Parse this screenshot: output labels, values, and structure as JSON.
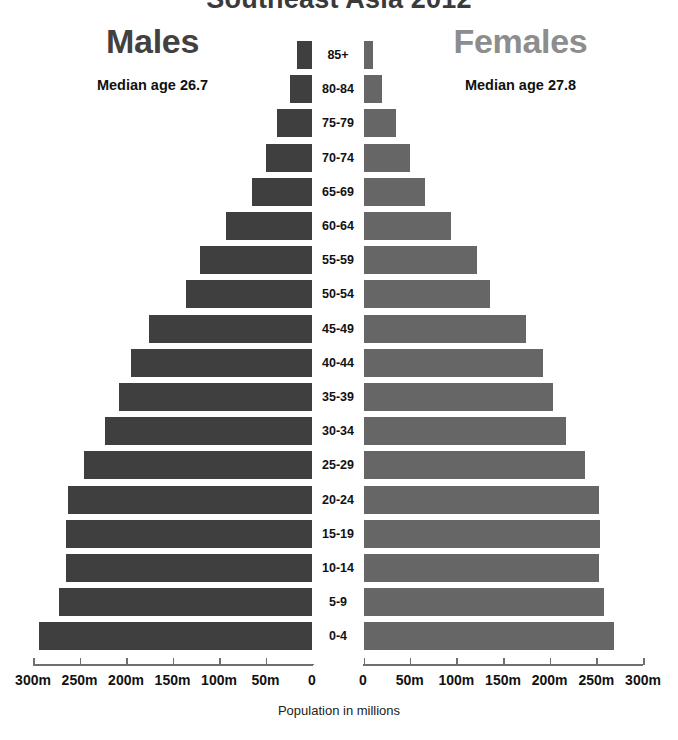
{
  "chart_title": "Southeast Asia 2012",
  "panels": {
    "male": {
      "heading": "Males",
      "median": "Median age 26.7",
      "color": "#3f3f3f",
      "heading_color": "#414141"
    },
    "female": {
      "heading": "Females",
      "median": "Median age 27.8",
      "color": "#666666",
      "heading_color": "#8d8d8d"
    }
  },
  "axis": {
    "caption": "Population in millions",
    "left_ticks": [
      "300m",
      "250m",
      "200m",
      "150m",
      "100m",
      "50m",
      "0"
    ],
    "right_ticks": [
      "0",
      "50m",
      "100m",
      "150m",
      "200m",
      "250m",
      "300m"
    ]
  },
  "chart_data": {
    "type": "bar",
    "title": "Southeast Asia 2012",
    "subtype": "population-pyramid",
    "xlabel": "Population in millions",
    "ylabel": "Age group",
    "xlim": [
      0,
      300
    ],
    "xtick_values": [
      0,
      50,
      100,
      150,
      200,
      250,
      300
    ],
    "grid": false,
    "legend": "none",
    "orientation": "horizontal",
    "categories": [
      "85+",
      "80-84",
      "75-79",
      "70-74",
      "65-69",
      "60-64",
      "55-59",
      "50-54",
      "45-49",
      "40-44",
      "35-39",
      "30-34",
      "25-29",
      "20-24",
      "15-19",
      "10-14",
      "5-9",
      "0-4"
    ],
    "series": [
      {
        "name": "Males",
        "color": "#3f3f3f",
        "side": "left",
        "values": [
          16,
          24,
          38,
          50,
          65,
          92,
          120,
          136,
          175,
          195,
          208,
          223,
          245,
          262,
          265,
          265,
          272,
          294
        ]
      },
      {
        "name": "Females",
        "color": "#666666",
        "side": "right",
        "values": [
          11,
          20,
          35,
          50,
          66,
          94,
          122,
          136,
          175,
          193,
          204,
          218,
          238,
          253,
          254,
          253,
          258,
          269
        ]
      }
    ],
    "annotations": [
      {
        "text": "Median age 26.7",
        "series": "Males"
      },
      {
        "text": "Median age 27.8",
        "series": "Females"
      }
    ]
  }
}
